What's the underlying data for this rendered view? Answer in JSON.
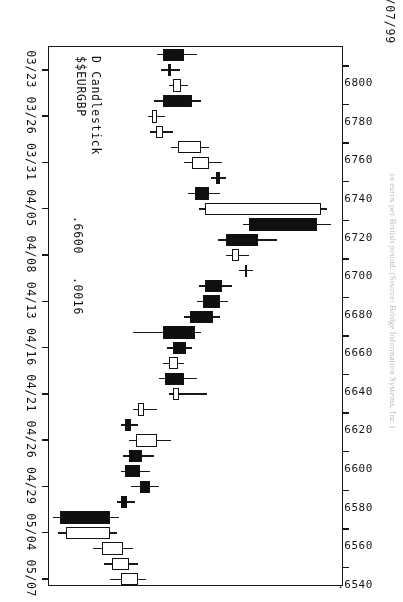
{
  "header": {
    "corner_date": "05/07/99",
    "legend_line1": "D Candlestick",
    "legend_line2": "$$EURGBP",
    "price_note_last": ".6600",
    "price_note_change": ".0016"
  },
  "caption": {
    "text": "in euros per British pound. (Source: Bridge Information Systems, Inc.)"
  },
  "colors": {
    "up_body": "#ffffff",
    "down_body": "#111111",
    "axis": "#1a1a1a",
    "background": "#ffffff"
  },
  "chart_data": {
    "type": "candlestick",
    "title": "D Candlestick  $$EURGBP",
    "xlabel": "",
    "ylabel": "",
    "grid": false,
    "legend_position": "none",
    "ylim": [
      0.653,
      0.681
    ],
    "ytick_labels": [
      ".6800",
      ".6780",
      ".6760",
      ".6740",
      ".6720",
      ".6700",
      ".6680",
      ".6660",
      ".6640",
      ".6620",
      ".6600",
      ".6580",
      ".6560",
      ".6540"
    ],
    "ytick_values": [
      0.68,
      0.678,
      0.676,
      0.674,
      0.672,
      0.67,
      0.668,
      0.666,
      0.664,
      0.662,
      0.66,
      0.658,
      0.656,
      0.654
    ],
    "xtick_labels": [
      "03/23",
      "03/26",
      "03/31",
      "04/05",
      "04/08",
      "04/13",
      "04/16",
      "04/21",
      "04/26",
      "04/29",
      "05/04",
      "05/07"
    ],
    "candles": [
      {
        "date": "03/22",
        "open": 0.666,
        "high": 0.6672,
        "low": 0.6634,
        "close": 0.664,
        "direction": "down"
      },
      {
        "date": "03/23",
        "open": 0.6648,
        "high": 0.6656,
        "low": 0.6638,
        "close": 0.6645,
        "direction": "down"
      },
      {
        "date": "03/24",
        "open": 0.6657,
        "high": 0.6664,
        "low": 0.6646,
        "close": 0.665,
        "direction": "up"
      },
      {
        "date": "03/25",
        "open": 0.6668,
        "high": 0.6676,
        "low": 0.6632,
        "close": 0.664,
        "direction": "down"
      },
      {
        "date": "03/26",
        "open": 0.6634,
        "high": 0.6642,
        "low": 0.6626,
        "close": 0.663,
        "direction": "up"
      },
      {
        "date": "03/29",
        "open": 0.664,
        "high": 0.665,
        "low": 0.6628,
        "close": 0.6633,
        "direction": "up"
      },
      {
        "date": "03/30",
        "open": 0.6676,
        "high": 0.6684,
        "low": 0.6648,
        "close": 0.6654,
        "direction": "up"
      },
      {
        "date": "03/31",
        "open": 0.6684,
        "high": 0.6696,
        "low": 0.666,
        "close": 0.6668,
        "direction": "up"
      },
      {
        "date": "04/01",
        "open": 0.6694,
        "high": 0.67,
        "low": 0.6686,
        "close": 0.669,
        "direction": "down"
      },
      {
        "date": "04/02",
        "open": 0.6684,
        "high": 0.6694,
        "low": 0.6664,
        "close": 0.667,
        "direction": "down"
      },
      {
        "date": "04/05",
        "open": 0.679,
        "high": 0.6796,
        "low": 0.6674,
        "close": 0.668,
        "direction": "up"
      },
      {
        "date": "04/06",
        "open": 0.6786,
        "high": 0.68,
        "low": 0.6716,
        "close": 0.6722,
        "direction": "down"
      },
      {
        "date": "04/07",
        "open": 0.673,
        "high": 0.6748,
        "low": 0.6692,
        "close": 0.67,
        "direction": "down"
      },
      {
        "date": "04/08",
        "open": 0.6712,
        "high": 0.6722,
        "low": 0.67,
        "close": 0.6706,
        "direction": "up"
      },
      {
        "date": "04/09",
        "open": 0.672,
        "high": 0.6726,
        "low": 0.6712,
        "close": 0.6718,
        "direction": "down"
      },
      {
        "date": "04/12",
        "open": 0.6696,
        "high": 0.6706,
        "low": 0.6674,
        "close": 0.668,
        "direction": "down"
      },
      {
        "date": "04/13",
        "open": 0.6694,
        "high": 0.6702,
        "low": 0.6672,
        "close": 0.6678,
        "direction": "down"
      },
      {
        "date": "04/14",
        "open": 0.6688,
        "high": 0.6694,
        "low": 0.666,
        "close": 0.6666,
        "direction": "down"
      },
      {
        "date": "04/15",
        "open": 0.667,
        "high": 0.6676,
        "low": 0.6612,
        "close": 0.664,
        "direction": "down"
      },
      {
        "date": "04/16",
        "open": 0.6662,
        "high": 0.6668,
        "low": 0.6644,
        "close": 0.665,
        "direction": "down"
      },
      {
        "date": "04/19",
        "open": 0.6654,
        "high": 0.666,
        "low": 0.664,
        "close": 0.6646,
        "direction": "up"
      },
      {
        "date": "04/20",
        "open": 0.666,
        "high": 0.6672,
        "low": 0.6636,
        "close": 0.6642,
        "direction": "down"
      },
      {
        "date": "04/21",
        "open": 0.6655,
        "high": 0.6682,
        "low": 0.6646,
        "close": 0.665,
        "direction": "up"
      },
      {
        "date": "04/22",
        "open": 0.6622,
        "high": 0.6634,
        "low": 0.6612,
        "close": 0.6616,
        "direction": "up"
      },
      {
        "date": "04/23",
        "open": 0.661,
        "high": 0.6616,
        "low": 0.66,
        "close": 0.6604,
        "direction": "down"
      },
      {
        "date": "04/26",
        "open": 0.6634,
        "high": 0.6648,
        "low": 0.6608,
        "close": 0.6614,
        "direction": "up"
      },
      {
        "date": "04/27",
        "open": 0.662,
        "high": 0.6632,
        "low": 0.6602,
        "close": 0.6608,
        "direction": "down"
      },
      {
        "date": "04/28",
        "open": 0.6618,
        "high": 0.6628,
        "low": 0.66,
        "close": 0.6604,
        "direction": "down"
      },
      {
        "date": "04/29",
        "open": 0.6628,
        "high": 0.6636,
        "low": 0.661,
        "close": 0.6618,
        "direction": "down"
      },
      {
        "date": "04/30",
        "open": 0.6606,
        "high": 0.6614,
        "low": 0.6596,
        "close": 0.66,
        "direction": "down"
      },
      {
        "date": "05/03",
        "open": 0.659,
        "high": 0.6598,
        "low": 0.6536,
        "close": 0.6542,
        "direction": "down"
      },
      {
        "date": "05/04",
        "open": 0.659,
        "high": 0.6596,
        "low": 0.654,
        "close": 0.6548,
        "direction": "up"
      },
      {
        "date": "05/05",
        "open": 0.6602,
        "high": 0.6612,
        "low": 0.6574,
        "close": 0.6582,
        "direction": "up"
      },
      {
        "date": "05/06",
        "open": 0.6608,
        "high": 0.6616,
        "low": 0.6584,
        "close": 0.6592,
        "direction": "up"
      },
      {
        "date": "05/07",
        "open": 0.6616,
        "high": 0.6624,
        "low": 0.659,
        "close": 0.66,
        "direction": "up"
      }
    ]
  }
}
